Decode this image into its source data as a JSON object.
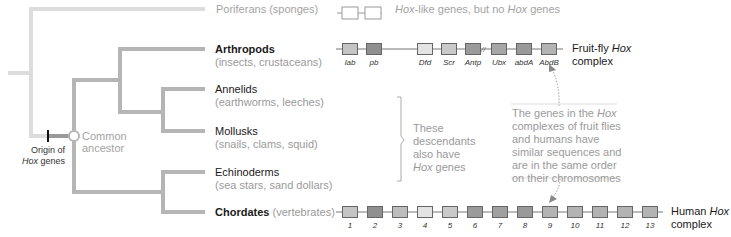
{
  "colors": {
    "poriferan_line": "#dcdcdc",
    "branch": "#b5b5b5",
    "origin_dark": "#8c8c8c",
    "text_dark": "#1a1a1a",
    "text_gray": "#9a9a9a"
  },
  "taxa": [
    {
      "id": "poriferans",
      "name": "Poriferans (sponges)",
      "bold": false
    },
    {
      "id": "arthropods",
      "name": "Arthropods",
      "sub": "(insects, crustaceans)",
      "bold": true
    },
    {
      "id": "annelids",
      "name": "Annelids",
      "sub": "(earthworms, leeches)",
      "bold": false
    },
    {
      "id": "mollusks",
      "name": "Mollusks",
      "sub": "(snails, clams, squid)",
      "bold": false
    },
    {
      "id": "echinoderms",
      "name": "Echinoderms",
      "sub": "(sea stars, sand dollars)",
      "bold": false
    },
    {
      "id": "chordates",
      "name": "Chordates",
      "sub": "(vertebrates)",
      "bold": true
    }
  ],
  "nodes": {
    "common_ancestor": {
      "line1": "Common",
      "line2": "ancestor"
    },
    "origin": {
      "line1": "Origin of",
      "line2_italic": "Hox",
      "line2_rest": " genes"
    }
  },
  "bracket_note": {
    "line1": "These",
    "line2": "descendants",
    "line3": "also have",
    "line4_italic": "Hox",
    "line4_rest": " genes"
  },
  "poriferan_genes": {
    "italic1": "Hox",
    "text1": "-like genes, but no ",
    "italic2": "Hox",
    "text2": " genes"
  },
  "fly_complex": {
    "label_line1": "Fruit-fly ",
    "label_italic": "Hox",
    "label_line2": "complex",
    "genes": [
      {
        "name": "lab",
        "color": "#c4c4c4"
      },
      {
        "name": "pb",
        "color": "#8f8f8f"
      },
      {
        "name": "Dfd",
        "color": "#e3e3e3"
      },
      {
        "name": "Scr",
        "color": "#c9c9c9"
      },
      {
        "name": "Antp",
        "color": "#9a9a9a"
      },
      {
        "name": "Ubx",
        "color": "#a6a6a6"
      },
      {
        "name": "abdA",
        "color": "#999999"
      },
      {
        "name": "AbdB",
        "color": "#b3b3b3"
      }
    ]
  },
  "human_complex": {
    "label_line1": "Human ",
    "label_italic": "Hox",
    "label_line2": "complex",
    "genes": [
      {
        "name": "1",
        "color": "#c4c4c4"
      },
      {
        "name": "2",
        "color": "#8f8f8f"
      },
      {
        "name": "3",
        "color": "#bdbdbd"
      },
      {
        "name": "4",
        "color": "#e3e3e3"
      },
      {
        "name": "5",
        "color": "#c9c9c9"
      },
      {
        "name": "6",
        "color": "#9a9a9a"
      },
      {
        "name": "7",
        "color": "#a0a0a0"
      },
      {
        "name": "8",
        "color": "#999999"
      },
      {
        "name": "9",
        "color": "#b3b3b3"
      },
      {
        "name": "10",
        "color": "#b3b3b3"
      },
      {
        "name": "11",
        "color": "#b3b3b3"
      },
      {
        "name": "12",
        "color": "#b3b3b3"
      },
      {
        "name": "13",
        "color": "#b3b3b3"
      }
    ]
  },
  "comparison_note": {
    "l1a": "The genes in the ",
    "l1i": "Hox",
    "l2": "complexes of fruit flies",
    "l3": "and humans have",
    "l4": "similar sequences and",
    "l5": "are in the same order",
    "l6": "on their chromosomes"
  }
}
